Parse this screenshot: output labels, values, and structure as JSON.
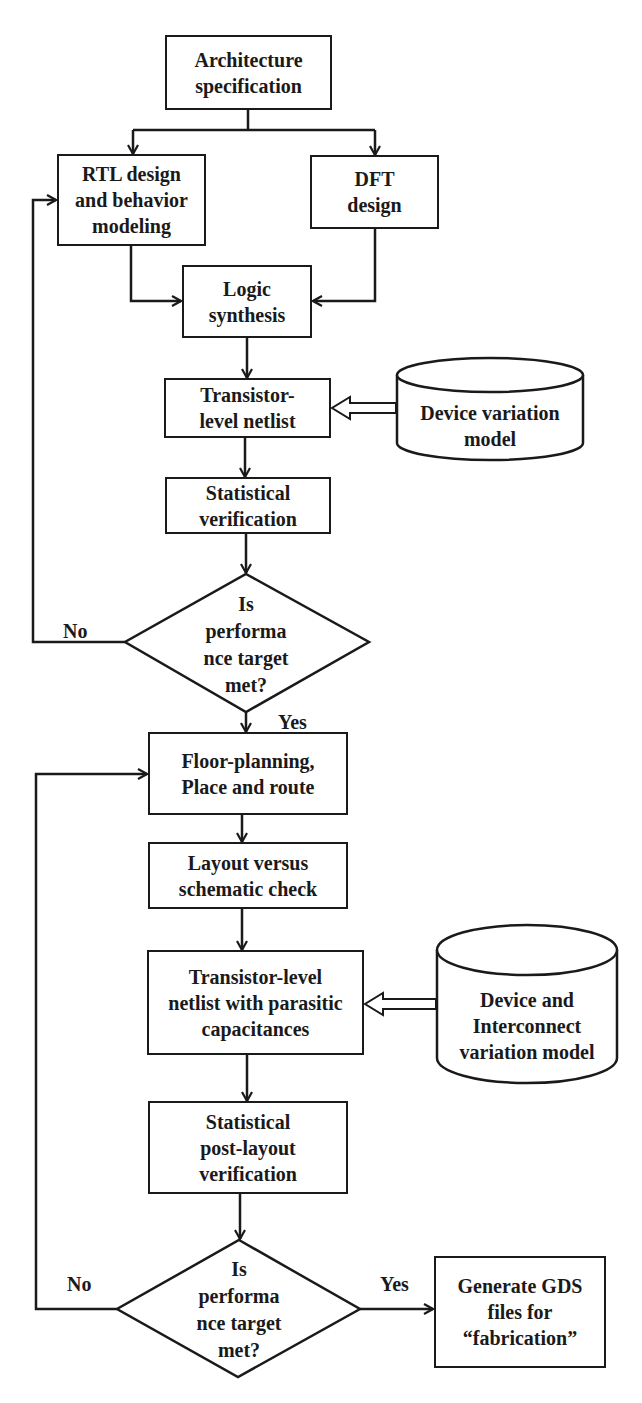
{
  "diagram": {
    "colors": {
      "stroke": "#1a1a1a",
      "background": "#ffffff"
    },
    "nodes": {
      "arch_spec": {
        "type": "process",
        "label": "Architecture\nspecification"
      },
      "rtl_design": {
        "type": "process",
        "label": "RTL design\nand behavior\nmodeling"
      },
      "dft_design": {
        "type": "process",
        "label": "DFT\ndesign"
      },
      "logic_synthesis": {
        "type": "process",
        "label": "Logic\nsynthesis"
      },
      "transistor_netlist": {
        "type": "process",
        "label": "Transistor-\nlevel netlist"
      },
      "device_variation_model": {
        "type": "database",
        "label": "Device variation\nmodel"
      },
      "statistical_verification": {
        "type": "process",
        "label": "Statistical\nverification"
      },
      "decision_1": {
        "type": "decision",
        "label": "Is\nperforma\nnce target\nmet?"
      },
      "floor_planning": {
        "type": "process",
        "label": "Floor-planning,\nPlace and route"
      },
      "lvs_check": {
        "type": "process",
        "label": "Layout versus\nschematic check"
      },
      "parasitic_netlist": {
        "type": "process",
        "label": "Transistor-level\nnetlist with parasitic\ncapacitances"
      },
      "interconnect_model": {
        "type": "database",
        "label": "Device and\nInterconnect\nvariation model"
      },
      "post_layout_verification": {
        "type": "process",
        "label": "Statistical\npost-layout\nverification"
      },
      "decision_2": {
        "type": "decision",
        "label": "Is\nperforma\nnce target\nmet?"
      },
      "generate_gds": {
        "type": "process",
        "label": "Generate GDS\nfiles for\n“fabrication”"
      }
    },
    "edge_labels": {
      "d1_no": "No",
      "d1_yes": "Yes",
      "d2_no": "No",
      "d2_yes": "Yes"
    },
    "edges": [
      {
        "from": "arch_spec",
        "to": "rtl_design"
      },
      {
        "from": "arch_spec",
        "to": "dft_design"
      },
      {
        "from": "rtl_design",
        "to": "logic_synthesis"
      },
      {
        "from": "dft_design",
        "to": "logic_synthesis"
      },
      {
        "from": "logic_synthesis",
        "to": "transistor_netlist"
      },
      {
        "from": "device_variation_model",
        "to": "transistor_netlist",
        "style": "hollow-double"
      },
      {
        "from": "transistor_netlist",
        "to": "statistical_verification"
      },
      {
        "from": "statistical_verification",
        "to": "decision_1"
      },
      {
        "from": "decision_1",
        "to": "rtl_design",
        "label": "No"
      },
      {
        "from": "decision_1",
        "to": "floor_planning",
        "label": "Yes"
      },
      {
        "from": "floor_planning",
        "to": "lvs_check"
      },
      {
        "from": "lvs_check",
        "to": "parasitic_netlist"
      },
      {
        "from": "interconnect_model",
        "to": "parasitic_netlist",
        "style": "hollow-double"
      },
      {
        "from": "parasitic_netlist",
        "to": "post_layout_verification"
      },
      {
        "from": "post_layout_verification",
        "to": "decision_2"
      },
      {
        "from": "decision_2",
        "to": "floor_planning",
        "label": "No"
      },
      {
        "from": "decision_2",
        "to": "generate_gds",
        "label": "Yes"
      }
    ]
  }
}
